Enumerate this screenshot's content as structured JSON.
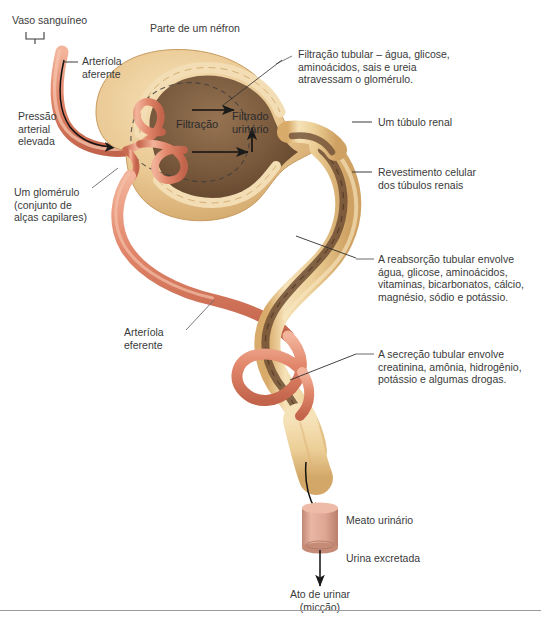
{
  "figure": {
    "title_alt": "Parte de um néfron - filtração, reabsorção e secreção tubular",
    "background_color": "#ffffff",
    "text_color": "#3a3a3a"
  },
  "colors": {
    "artery": "#e2876c",
    "artery_light": "#f0a98f",
    "artery_dark": "#c96b52",
    "capsule": "#e9c791",
    "capsule_light": "#f3ddb4",
    "capsule_dark": "#cfa263",
    "lumen": "#7c5a3c",
    "lumen_dark": "#5d402a",
    "tubule": "#edcf99",
    "meatus": "#dda693",
    "meatus_dark": "#c08874",
    "arrow": "#1a1a1a",
    "leader": "#555555",
    "rule": "#9a9a9a"
  },
  "labels": {
    "vaso_sanguineo": "Vaso sanguíneo",
    "arteriola_aferente": "Arteríola\naferente",
    "pressao_arterial": "Pressão\narterial\nelevada",
    "um_glomerulo": "Um glomérulo\n(conjunto de\nalças capilares)",
    "arteriola_eferente": "Arteríola\neferente",
    "parte_nefron": "Parte de um néfron",
    "filtracao_tubular": "Filtração tubular – água, glicose,\naminoácidos, sais e ureia\natravessam o glomérulo.",
    "um_tubulo_renal": "Um túbulo renal",
    "revestimento": "Revestimento celular\ndos túbulos renais",
    "reabsorcao": "A reabsorção tubular envolve\nágua, glicose, aminoácidos,\nvitaminas, bicarbonatos, cálcio,\nmagnésio, sódio e potássio.",
    "secrecao": "A secreção tubular envolve\ncreatinina, amônia, hidrogênio,\npotássio e algumas drogas.",
    "filtracao": "Filtração",
    "filtrado_urinario": "Filtrado\nurinário",
    "meato_urinario": "Meato urinário",
    "urina_excretada": "Urina excretada",
    "ato_de_urinar": "Ato de urinar\n(micção)"
  }
}
